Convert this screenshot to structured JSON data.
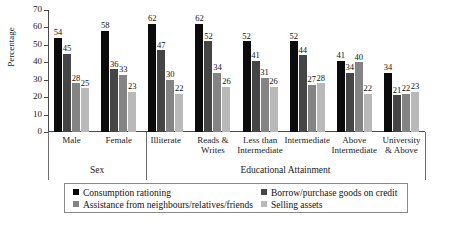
{
  "chart_data": {
    "type": "bar",
    "title": "",
    "xlabel": "",
    "ylabel": "Percentage",
    "ylim": [
      0,
      70
    ],
    "yticks": [
      0,
      10,
      20,
      30,
      40,
      50,
      60,
      70
    ],
    "grid": false,
    "legend_position": "bottom",
    "categories": [
      "Male",
      "Female",
      "Illiterate",
      "Reads &\nWrites",
      "Less than\nIntermediate",
      "Intermediate",
      "Above\nIntermediate",
      "University\n& Above"
    ],
    "supergroups": [
      {
        "label": "Sex",
        "categories": [
          "Male",
          "Female"
        ]
      },
      {
        "label": "Educational Attainment",
        "categories": [
          "Illiterate",
          "Reads & Writes",
          "Less than Intermediate",
          "Intermediate",
          "Above Intermediate",
          "University & Above"
        ]
      }
    ],
    "series": [
      {
        "name": "Consumption rationing",
        "color": "#0b0b0b",
        "values": [
          54,
          58,
          62,
          62,
          52,
          52,
          41,
          34
        ]
      },
      {
        "name": "Borrow/purchase goods on credit",
        "color": "#454545",
        "values": [
          45,
          36,
          47,
          52,
          41,
          44,
          34,
          21
        ]
      },
      {
        "name": "Assistance from neighbours/relatives/friends",
        "color": "#848484",
        "values": [
          28,
          33,
          30,
          34,
          31,
          27,
          40,
          22
        ]
      },
      {
        "name": "Selling assets",
        "color": "#b9b9b9",
        "values": [
          25,
          23,
          22,
          26,
          26,
          28,
          22,
          23
        ]
      }
    ]
  },
  "axis": {
    "ylabel": "Percentage",
    "tick_labels": [
      "70",
      "60",
      "50",
      "40",
      "30",
      "20",
      "10",
      "0"
    ]
  },
  "legend": {
    "entries": [
      {
        "label": "Consumption rationing",
        "swatch": "sw0"
      },
      {
        "label": "Borrow/purchase goods on credit",
        "swatch": "sw1"
      },
      {
        "label": "Assistance from neighbours/relatives/friends",
        "swatch": "sw2"
      },
      {
        "label": "Selling assets",
        "swatch": "sw3"
      }
    ]
  },
  "supergroup_labels": {
    "sex": "Sex",
    "education": "Educational Attainment"
  },
  "category_labels": {
    "c0": "Male",
    "c1": "Female",
    "c2": "Illiterate",
    "c3": "Reads &\nWrites",
    "c4": "Less than\nIntermediate",
    "c5": "Intermediate",
    "c6": "Above\nIntermediate",
    "c7": "University\n& Above"
  }
}
